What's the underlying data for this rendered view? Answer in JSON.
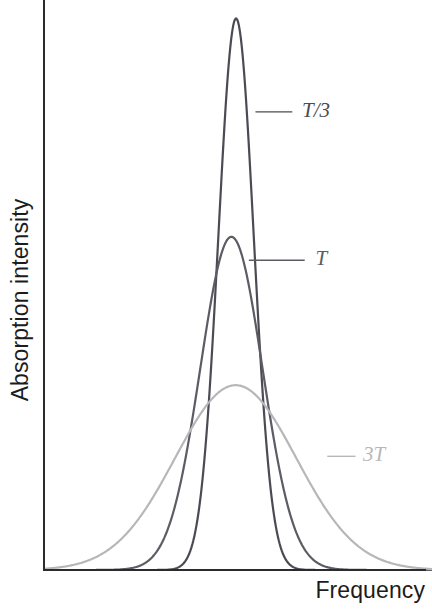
{
  "chart_data": {
    "type": "line",
    "title": "",
    "xlabel": "Frequency",
    "ylabel": "Absorption intensity",
    "grid": false,
    "legend_position": "inline-annotations",
    "xlim": [
      0,
      1
    ],
    "ylim": [
      0,
      1
    ],
    "axis_ticks": {
      "x": [],
      "y": []
    },
    "x_center": 0.495,
    "series": [
      {
        "name": "T/3",
        "label": "T/3",
        "color": "#4b4b53",
        "peak_x": 0.495,
        "peak_y": 0.985,
        "sigma": 0.0455,
        "linewidth": 2.2,
        "annotation": {
          "text": "T/3",
          "leader_from_x": 0.545,
          "leader_from_y": 0.818,
          "leader_to_x": 0.64,
          "leader_to_y": 0.818,
          "label_x": 0.665,
          "label_y": 0.818
        }
      },
      {
        "name": "T",
        "label": "T",
        "color": "#5c5c64",
        "peak_x": 0.483,
        "peak_y": 0.595,
        "sigma": 0.08,
        "linewidth": 2.2,
        "annotation": {
          "text": "T",
          "leader_from_x": 0.528,
          "leader_from_y": 0.553,
          "leader_to_x": 0.672,
          "leader_to_y": 0.553,
          "label_x": 0.7,
          "label_y": 0.553
        }
      },
      {
        "name": "3T",
        "label": "3T",
        "color": "#b7b7bb",
        "peak_x": 0.494,
        "peak_y": 0.33,
        "sigma": 0.156,
        "linewidth": 2.0,
        "annotation": {
          "text": "3T",
          "leader_from_x": 0.73,
          "leader_from_y": 0.203,
          "leader_to_x": 0.803,
          "leader_to_y": 0.203,
          "label_x": 0.822,
          "label_y": 0.203
        }
      }
    ]
  },
  "axes": {
    "x_axis_label": "Frequency",
    "y_axis_label": "Absorption intensity",
    "axis_color": "#2b2b2b"
  }
}
